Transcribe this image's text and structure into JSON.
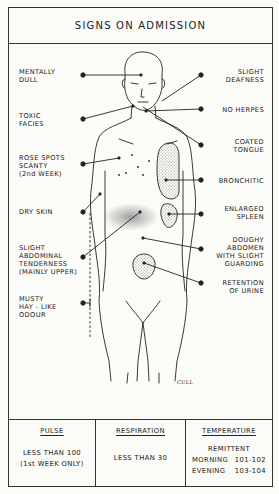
{
  "header": {
    "title": "SIGNS ON ADMISSION"
  },
  "labels_left": [
    {
      "id": "mentally-dull",
      "text": "MENTALLY\nDULL"
    },
    {
      "id": "toxic-facies",
      "text": "TOXIC\nFACIES"
    },
    {
      "id": "rose-spots",
      "text": "ROSE SPOTS\nSCANTY\n(2nd WEEK)"
    },
    {
      "id": "dry-skin",
      "text": "DRY SKIN"
    },
    {
      "id": "abdominal-tenderness",
      "text": "SLIGHT\nABDOMINAL\nTENDERNESS\n(MAINLY UPPER)"
    },
    {
      "id": "musty-odour",
      "text": "MUSTY\nHAY - LIKE\nODOUR"
    }
  ],
  "labels_right": [
    {
      "id": "slight-deafness",
      "text": "SLIGHT\nDEAFNESS"
    },
    {
      "id": "no-herpes",
      "text": "NO HERPES"
    },
    {
      "id": "coated-tongue",
      "text": "COATED\nTONGUE"
    },
    {
      "id": "bronchitic",
      "text": "BRONCHITIC"
    },
    {
      "id": "enlarged-spleen",
      "text": "ENLARGED\nSPLEEN"
    },
    {
      "id": "doughy-abdomen",
      "text": "DOUGHY\nABDOMEN\nWITH SLIGHT\nGUARDING"
    },
    {
      "id": "retention-urine",
      "text": "RETENTION\nOF URINE"
    }
  ],
  "signature": "CULL",
  "vitals": {
    "pulse": {
      "title": "PULSE",
      "line1": "LESS THAN 100",
      "line2": "(1st WEEK ONLY)"
    },
    "respiration": {
      "title": "RESPIRATION",
      "value": "LESS THAN 30"
    },
    "temperature": {
      "title": "TEMPERATURE",
      "type": "REMITTENT",
      "morning_label": "MORNING",
      "morning_value": "101-102",
      "evening_label": "EVENING",
      "evening_value": "103-104"
    }
  },
  "colors": {
    "ink": "#222222",
    "paper": "#fbfbf8",
    "border": "#333333"
  }
}
